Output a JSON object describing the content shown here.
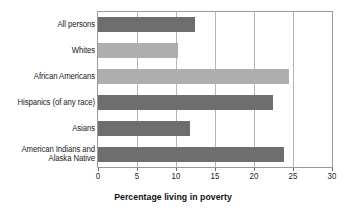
{
  "chart_data": {
    "type": "bar",
    "orientation": "horizontal",
    "title": "",
    "xlabel": "Percentage living in poverty",
    "ylabel": "",
    "xlim": [
      0,
      30
    ],
    "xticks": [
      0,
      5,
      10,
      15,
      20,
      25,
      30
    ],
    "xtick_labels": [
      "0",
      "5",
      "10",
      "15",
      "20",
      "25",
      "30"
    ],
    "grid": true,
    "grid_axis": "x",
    "legend": false,
    "categories": [
      "All persons",
      "Whites",
      "African Americans",
      "Hispanics (of any race)",
      "Asians",
      "American Indians and\nAlaska Native"
    ],
    "values": [
      12.4,
      10.2,
      24.5,
      22.4,
      11.8,
      23.8
    ],
    "bar_colors": [
      "#6e6e6e",
      "#aeaeae",
      "#aeaeae",
      "#6e6e6e",
      "#6e6e6e",
      "#6e6e6e"
    ],
    "colors": {
      "bar_dark": "#6e6e6e",
      "bar_light": "#aeaeae",
      "frame": "#9a9a9a",
      "gridline": "#b5b5b5",
      "text": "#1a1a1a"
    }
  }
}
